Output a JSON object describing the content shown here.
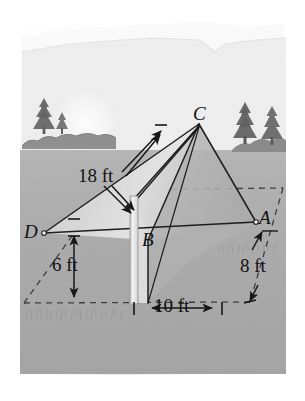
{
  "figure": {
    "kind": "geometry-illustration",
    "vertices": [
      {
        "id": "C",
        "label": "C",
        "role": "apex",
        "x": 199,
        "y": 124
      },
      {
        "id": "D",
        "label": "D",
        "role": "base-left",
        "x": 44,
        "y": 233
      },
      {
        "id": "B",
        "label": "B",
        "role": "base-front",
        "x": 148,
        "y": 240
      },
      {
        "id": "A",
        "label": "A",
        "role": "base-right",
        "x": 256,
        "y": 222
      }
    ],
    "dimensions": [
      {
        "id": "slant-edge",
        "label": "18 ft",
        "value": 18,
        "unit": "ft",
        "x": 107,
        "y": 175,
        "orientation": "leader-arrows"
      },
      {
        "id": "pole-height",
        "label": "6 ft",
        "value": 6,
        "unit": "ft",
        "x": 62,
        "y": 265,
        "orientation": "vertical"
      },
      {
        "id": "right-depth",
        "label": "8 ft",
        "value": 8,
        "unit": "ft",
        "x": 246,
        "y": 265,
        "orientation": "diagonal"
      },
      {
        "id": "base-width",
        "label": "10 ft",
        "value": 10,
        "unit": "ft",
        "x": 168,
        "y": 307,
        "orientation": "horizontal"
      }
    ],
    "scenery": {
      "horizon_y": 150,
      "sky_label": "sky",
      "hill_label": "hill",
      "sun_label": "sun",
      "ground_label": "ground",
      "trees_left": 1,
      "trees_right": 2,
      "hedge_label": "hedge"
    },
    "colors": {
      "page": "#ffffff",
      "sky": "#f2f2f2",
      "hill": "#e8e8e8",
      "ground": "#a9a9a9",
      "ground_far": "#b2b2b2",
      "tree": "#8a8a8a",
      "tree_dark": "#6f6f6f",
      "hedge": "#9a9a9a",
      "tent_light": "#d9d9d9",
      "tent_mid": "#c3c3c3",
      "tent_shade": "#b0b0b0",
      "pole": "#efefef",
      "ink": "#1a1a1a",
      "dash": "#4a4a4a"
    }
  }
}
